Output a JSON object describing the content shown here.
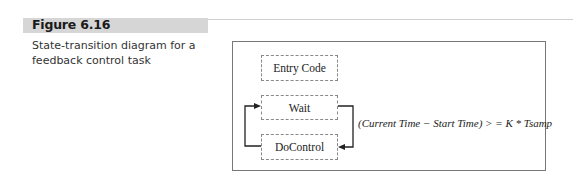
{
  "figure": {
    "label": "Figure 6.16",
    "caption": "State-transition diagram for a feedback control task"
  },
  "diagram": {
    "states": [
      {
        "id": "entry",
        "label": "Entry Code"
      },
      {
        "id": "wait",
        "label": "Wait"
      },
      {
        "id": "docontrol",
        "label": "DoControl"
      }
    ],
    "transitions": [
      {
        "from": "wait",
        "to": "docontrol",
        "condition": "(Current Time − Start Time) > = K * Tsamp"
      },
      {
        "from": "docontrol",
        "to": "wait",
        "condition": ""
      }
    ],
    "colors": {
      "title_bar": "#d6d6d6",
      "frame_border": "#777777",
      "state_border": "#888888",
      "arrow": "#222222"
    }
  }
}
